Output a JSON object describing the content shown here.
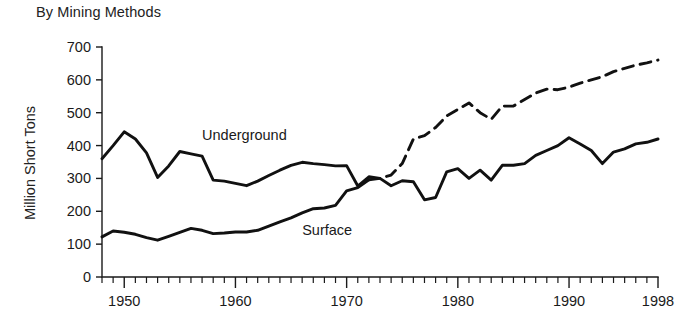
{
  "chart_data": {
    "type": "line",
    "title": "By Mining Methods",
    "xlabel": "",
    "ylabel": "Million Short Tons",
    "xlim": [
      1948,
      1998
    ],
    "ylim": [
      0,
      700
    ],
    "ytick_values": [
      0,
      100,
      200,
      300,
      400,
      500,
      600,
      700
    ],
    "ytick_labels": [
      "0",
      "100",
      "200",
      "300",
      "400",
      "500",
      "600",
      "700"
    ],
    "xtick_labels": [
      "1950",
      "1960",
      "1970",
      "1980",
      "1990",
      "1998"
    ],
    "xtick_values": [
      1950,
      1960,
      1970,
      1980,
      1990,
      1998
    ],
    "x_minor_tick_interval": 1,
    "grid": false,
    "legend": "inline-annotations",
    "x": [
      1948,
      1949,
      1950,
      1951,
      1952,
      1953,
      1954,
      1955,
      1956,
      1957,
      1958,
      1959,
      1960,
      1961,
      1962,
      1963,
      1964,
      1965,
      1966,
      1967,
      1968,
      1969,
      1970,
      1971,
      1972,
      1973,
      1974,
      1975,
      1976,
      1977,
      1978,
      1979,
      1980,
      1981,
      1982,
      1983,
      1984,
      1985,
      1986,
      1987,
      1988,
      1989,
      1990,
      1991,
      1992,
      1993,
      1994,
      1995,
      1996,
      1997,
      1998
    ],
    "series": [
      {
        "name": "Underground",
        "style": "solid",
        "label_x": 1957,
        "label_y": 418,
        "values": [
          360,
          400,
          442,
          420,
          378,
          303,
          338,
          382,
          375,
          368,
          295,
          292,
          285,
          278,
          292,
          309,
          325,
          340,
          349,
          345,
          342,
          338,
          339,
          277,
          305,
          300,
          278,
          293,
          290,
          235,
          242,
          320,
          330,
          300,
          325,
          295,
          340,
          340,
          345,
          370,
          385,
          400,
          424,
          405,
          385,
          345,
          380,
          390,
          405,
          410,
          420
        ]
      },
      {
        "name": "Surface",
        "style_solid_until": 1972,
        "style_after": "dashed",
        "label_x": 1966,
        "label_y": 128,
        "values": [
          122,
          140,
          136,
          130,
          120,
          112,
          124,
          136,
          148,
          142,
          132,
          134,
          137,
          137,
          142,
          155,
          168,
          180,
          195,
          208,
          210,
          218,
          262,
          272,
          296,
          300,
          310,
          345,
          420,
          430,
          455,
          490,
          510,
          530,
          500,
          480,
          520,
          520,
          540,
          560,
          572,
          570,
          578,
          590,
          600,
          610,
          625,
          635,
          645,
          652,
          660
        ]
      }
    ]
  }
}
